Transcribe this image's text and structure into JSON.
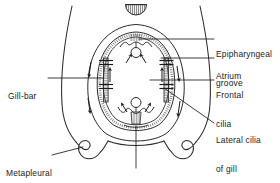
{
  "figure": {
    "background_color": "#ffffff",
    "ink_color": "#1a1a1a",
    "stroke_color": "#333333",
    "hatch_color": "#555555"
  },
  "labels": {
    "epipharyngeal_groove": {
      "line1": "Epipharyngeal",
      "line2": "groove"
    },
    "atrium": {
      "line1": "Atrium"
    },
    "frontal_cilia": {
      "line1": "Frontal",
      "line2": "cilia"
    },
    "lateral_cilia_of_gill": {
      "line1": "Lateral cilia",
      "line2": "of gill"
    },
    "gill_bar": {
      "line1": "Gill-bar"
    },
    "metapleural_fold": {
      "line1": "Metapleural",
      "line2": "fold"
    },
    "endostyle": {
      "line1": "Endostyle"
    }
  },
  "structures": [
    {
      "name": "dorsal-fin-ray",
      "description": "hatched semicircular dorsal fin ray at top"
    },
    {
      "name": "body-wall",
      "description": "outer body wall outline"
    },
    {
      "name": "atrium-cavity",
      "description": "atrial cavity surrounding the pharynx"
    },
    {
      "name": "pharynx-wall",
      "description": "pharyngeal basket wall"
    },
    {
      "name": "gill-bar-left",
      "description": "left gill bar with lateral cilia cross marks"
    },
    {
      "name": "gill-bar-right",
      "description": "right gill bar with lateral cilia cross marks"
    },
    {
      "name": "epipharyngeal-groove-structure",
      "description": "dorsal hypobranchial groove with central lumen circle"
    },
    {
      "name": "endostyle-structure",
      "description": "ventral endostyle with hatched lobes and central circle"
    },
    {
      "name": "flow-arrow",
      "description": "ciliary water current direction arrows"
    }
  ],
  "leader_lines": [
    {
      "name": "leader-epipharyngeal-groove"
    },
    {
      "name": "leader-atrium"
    },
    {
      "name": "leader-frontal-cilia"
    },
    {
      "name": "leader-lateral-cilia"
    },
    {
      "name": "leader-gill-bar"
    },
    {
      "name": "leader-metapleural-fold"
    },
    {
      "name": "leader-endostyle"
    }
  ]
}
